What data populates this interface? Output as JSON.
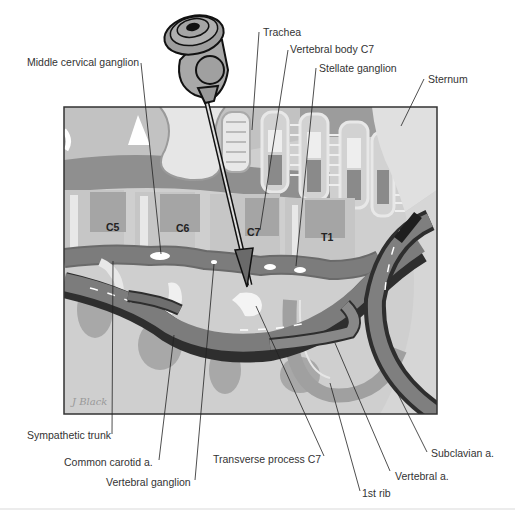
{
  "figure": {
    "colors": {
      "background": "#ffffff",
      "panel": "#c9c9c9",
      "light_gray": "#d8d8d8",
      "mid_gray": "#9a9a9a",
      "dark_gray": "#6e6e6e",
      "vessel": "#7a7a7a",
      "vessel_dark": "#2e2e2e",
      "ganglion_spot": "#ffffff",
      "line": "#222222"
    },
    "vertebra_labels": [
      "C5",
      "C6",
      "C7",
      "T1"
    ],
    "labels": {
      "middle_cervical_ganglion": "Middle cervical ganglion",
      "trachea": "Trachea",
      "vertebral_body_c7": "Vertebral body C7",
      "stellate_ganglion": "Stellate ganglion",
      "sternum": "Sternum",
      "sympathetic_trunk": "Sympathetic trunk",
      "common_carotid": "Common carotid a.",
      "vertebral_ganglion": "Vertebral ganglion",
      "transverse_process_c7": "Transverse process C7",
      "first_rib": "1st rib",
      "vertebral_artery": "Vertebral a.",
      "subclavian_artery": "Subclavian a."
    },
    "signature": "J Black"
  }
}
